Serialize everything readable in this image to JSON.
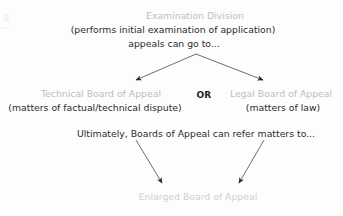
{
  "diagram": {
    "title_node": {
      "heading": "Examination Division",
      "line2": "(performs initial examination of application)",
      "line3": "appeals can go to..."
    },
    "branches": {
      "left": {
        "heading": "Technical Board of Appeal",
        "detail": "(matters of factual/technical dispute)"
      },
      "connector": "OR",
      "right": {
        "heading": "Legal Board of Appeal",
        "detail": "(matters of law)"
      }
    },
    "referral_note": "Ultimately, Boards of Appeal can refer matters to...",
    "final_node": {
      "heading": "Enlarged Board of Appeal"
    },
    "colors": {
      "node_heading": "#bdbdbd",
      "final_heading": "#cfcfcf",
      "body_text": "#2b2b2b",
      "connector_text": "#1f1f1f",
      "arrow_stroke": "#6e6e6e",
      "background": "#fdfdfd"
    }
  }
}
